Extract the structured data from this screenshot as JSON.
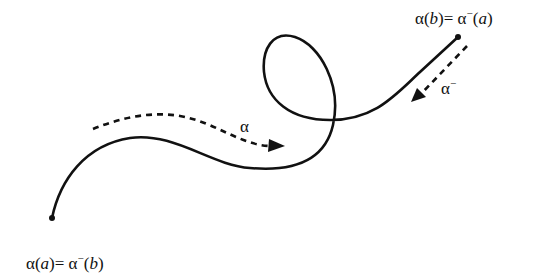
{
  "diagram": {
    "start_label": {
      "fn": "α",
      "arg": "a",
      "eq": "= ",
      "inv_fn": "α",
      "inv_sup": "−",
      "inv_arg": "b"
    },
    "end_label": {
      "fn": "α",
      "arg": "b",
      "eq": "= ",
      "inv_fn": "α",
      "inv_sup": "−",
      "inv_arg": "a"
    },
    "forward_path_label": "α",
    "reverse_path_label": {
      "base": "α",
      "sup": "−"
    },
    "colors": {
      "stroke": "#111111",
      "background": "#ffffff"
    }
  }
}
